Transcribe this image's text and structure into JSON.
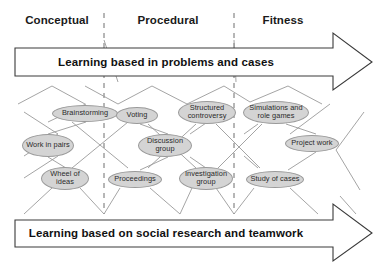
{
  "diagram": {
    "title_columns": [
      {
        "label": "Conceptual",
        "x": 14,
        "y": 14,
        "width": 86
      },
      {
        "label": "Procedural",
        "x": 110,
        "y": 14,
        "width": 116
      },
      {
        "label": "Fitness",
        "x": 240,
        "y": 14,
        "width": 86
      }
    ],
    "dividers": [
      {
        "name": "divider-conceptual-procedural",
        "x": 104
      },
      {
        "name": "divider-procedural-fitness",
        "x": 234
      }
    ],
    "arrows": [
      {
        "name": "top-arrow",
        "label": "Learning based in problems and cases",
        "label_x": 16,
        "label_y": 62,
        "label_width": 300
      },
      {
        "name": "bottom-arrow",
        "label": "Learning based on social research and teamwork",
        "label_x": 16,
        "label_y": 233,
        "label_width": 300
      }
    ],
    "nodes": [
      {
        "name": "node-brainstorming",
        "label": "Brainstorming",
        "cx": 85,
        "cy": 113,
        "w": 66,
        "h": 17
      },
      {
        "name": "node-voting",
        "label": "Voting",
        "cx": 137,
        "cy": 115,
        "w": 42,
        "h": 17
      },
      {
        "name": "node-structured-controversy",
        "label": "Structured controversy",
        "cx": 207,
        "cy": 112,
        "w": 58,
        "h": 23
      },
      {
        "name": "node-simulations-role-games",
        "label": "Simulations and role games",
        "cx": 276,
        "cy": 112,
        "w": 66,
        "h": 23
      },
      {
        "name": "node-work-in-pairs",
        "label": "Work in pairs",
        "cx": 48,
        "cy": 145,
        "w": 52,
        "h": 23
      },
      {
        "name": "node-discussion-group",
        "label": "Discussion group",
        "cx": 165,
        "cy": 145,
        "w": 54,
        "h": 23
      },
      {
        "name": "node-project-work",
        "label": "Project work",
        "cx": 312,
        "cy": 143,
        "w": 54,
        "h": 17
      },
      {
        "name": "node-wheel-of-ideas",
        "label": "Wheel of ideas",
        "cx": 65,
        "cy": 178,
        "w": 48,
        "h": 23
      },
      {
        "name": "node-proceedings",
        "label": "Proceedings",
        "cx": 135,
        "cy": 179,
        "w": 54,
        "h": 17
      },
      {
        "name": "node-investigation-group",
        "label": "Investigation group",
        "cx": 206,
        "cy": 178,
        "w": 54,
        "h": 23
      },
      {
        "name": "node-study-of-cases",
        "label": "Study of cases",
        "cx": 275,
        "cy": 179,
        "w": 58,
        "h": 17
      }
    ]
  },
  "colors": {
    "node_fill": "#d4d4d4",
    "node_stroke": "#9a9a9a",
    "line": "#8c8c8c",
    "arrow_stroke": "#3a3a3a",
    "text": "#1a1a1a",
    "background": "#ffffff"
  }
}
